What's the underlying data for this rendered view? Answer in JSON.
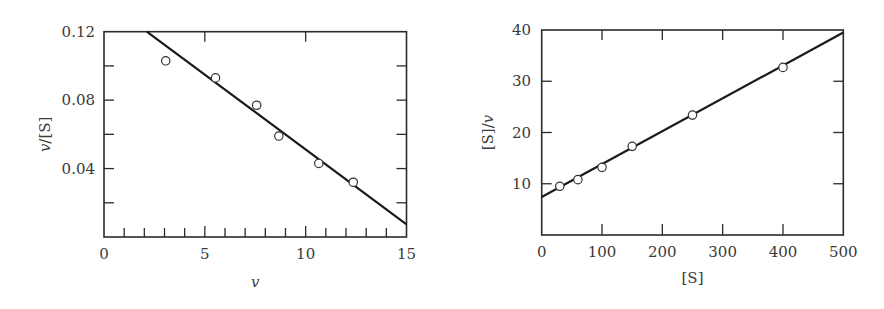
{
  "chart_data": [
    {
      "type": "scatter",
      "title": "",
      "xlabel": "v",
      "ylabel": "v/[S]",
      "xlim": [
        0,
        15
      ],
      "ylim": [
        0,
        0.12
      ],
      "x_ticks": [
        0,
        5,
        10,
        15
      ],
      "x_tick_labels": [
        "0",
        "5",
        "10",
        "15"
      ],
      "x_minor_tick_step": 1,
      "y_ticks": [
        0.04,
        0.08,
        0.12
      ],
      "y_tick_labels": [
        "0.04",
        "0.08",
        "0.12"
      ],
      "y_minor_tick_step": 0.02,
      "grid": false,
      "marker": "open-circle",
      "points": {
        "x": [
          3.06,
          5.53,
          7.57,
          8.67,
          10.65,
          12.36
        ],
        "y": [
          0.103,
          0.093,
          0.077,
          0.059,
          0.043,
          0.032
        ]
      },
      "fit_line": {
        "x": [
          2.12,
          15
        ],
        "y": [
          0.12,
          0.0074
        ]
      }
    },
    {
      "type": "scatter",
      "title": "",
      "xlabel": "[S]",
      "ylabel": "[S]/v",
      "xlim": [
        0,
        500
      ],
      "ylim": [
        0,
        40
      ],
      "x_ticks": [
        0,
        100,
        200,
        300,
        400,
        500
      ],
      "x_tick_labels": [
        "0",
        "100",
        "200",
        "300",
        "400",
        "500"
      ],
      "y_ticks": [
        10,
        20,
        30,
        40
      ],
      "y_tick_labels": [
        "10",
        "20",
        "30",
        "40"
      ],
      "grid": false,
      "marker": "open-circle",
      "points": {
        "x": [
          30,
          60,
          100,
          150,
          250,
          400
        ],
        "y": [
          9.5,
          10.8,
          13.2,
          17.3,
          23.4,
          32.7
        ]
      },
      "fit_line": {
        "x": [
          0,
          500
        ],
        "y": [
          7.4,
          39.5
        ]
      }
    }
  ],
  "colors": {
    "axis": "#2a2a2a",
    "line": "#1a1a1a",
    "marker_edge": "#333333",
    "marker_fill": "#ffffff"
  }
}
